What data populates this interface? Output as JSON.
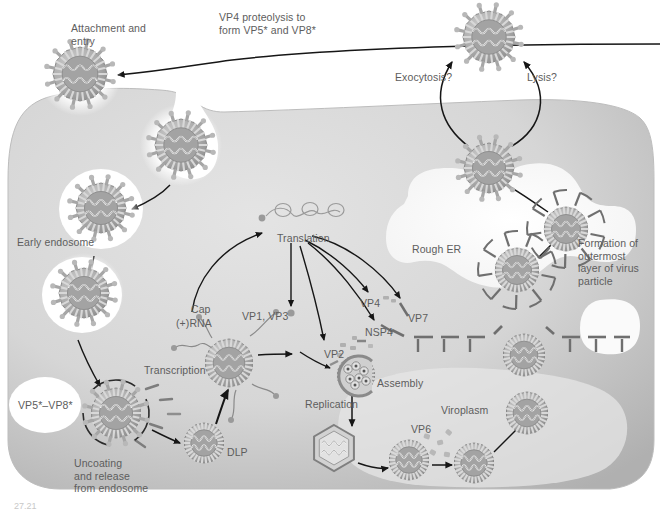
{
  "figure": {
    "caption": "27.21"
  },
  "palette": {
    "background": "#ffffff",
    "cytoplasm": "#d9d9d9",
    "cytoplasm_edge": "#a9a9a9",
    "lumen": "#fbfbfb",
    "capsid": "#9a9a9a",
    "capsid_light": "#c4c4c4",
    "text": "#5d5d5d",
    "arrow": "#1a1a1a"
  },
  "labels": {
    "attachment": "Attachment and\nentry",
    "vp4_proteolysis": "VP4 proteolysis to\nform VP5* and VP8*",
    "exocytosis": "Exocytosis?",
    "lysis": "Lysis?",
    "early_endosome": "Early endosome",
    "vp5_vp8": "VP5*–VP8*",
    "uncoating": "Uncoating\nand release\nfrom endosome",
    "transcription": "Transcription",
    "dlp": "DLP",
    "cap": "Cap",
    "plus_rna": "(+)RNA",
    "translation": "Translation",
    "vp1_vp3": "VP1, VP3",
    "vp2": "VP2",
    "vp4": "VP4",
    "vp6": "VP6",
    "vp7": "VP7",
    "nsp4": "NSP4",
    "assembly": "Assembly",
    "replication": "Replication",
    "viroplasm": "Viroplasm",
    "rough_er": "Rough ER",
    "formation": "Formation of\noutermost\nlayer of virus\nparticle"
  },
  "label_positions": [
    {
      "key": "attachment",
      "name": "label-attachment-and-entry",
      "x": 71,
      "y": 22,
      "align": "left"
    },
    {
      "key": "vp4_proteolysis",
      "name": "label-vp4-proteolysis",
      "x": 219,
      "y": 11,
      "align": "left"
    },
    {
      "key": "exocytosis",
      "name": "label-exocytosis",
      "x": 395,
      "y": 71,
      "align": "left"
    },
    {
      "key": "lysis",
      "name": "label-lysis",
      "x": 527,
      "y": 71,
      "align": "left"
    },
    {
      "key": "early_endosome",
      "name": "label-early-endosome",
      "x": 17,
      "y": 236,
      "align": "left"
    },
    {
      "key": "vp5_vp8",
      "name": "label-vp5-vp8",
      "x": 18,
      "y": 399,
      "align": "left"
    },
    {
      "key": "uncoating",
      "name": "label-uncoating-and-release",
      "x": 74,
      "y": 457,
      "align": "left"
    },
    {
      "key": "transcription",
      "name": "label-transcription",
      "x": 144,
      "y": 364,
      "align": "left"
    },
    {
      "key": "dlp",
      "name": "label-dlp",
      "x": 227,
      "y": 446,
      "align": "left"
    },
    {
      "key": "cap",
      "name": "label-cap",
      "x": 191,
      "y": 303,
      "align": "left"
    },
    {
      "key": "plus_rna",
      "name": "label-plus-rna",
      "x": 176,
      "y": 317,
      "align": "left"
    },
    {
      "key": "translation",
      "name": "label-translation",
      "x": 277,
      "y": 232,
      "align": "left"
    },
    {
      "key": "vp1_vp3",
      "name": "label-vp1-vp3",
      "x": 242,
      "y": 310,
      "align": "left"
    },
    {
      "key": "vp2",
      "name": "label-vp2",
      "x": 324,
      "y": 348,
      "align": "left"
    },
    {
      "key": "vp4",
      "name": "label-vp4",
      "x": 360,
      "y": 297,
      "align": "left"
    },
    {
      "key": "vp6",
      "name": "label-vp6",
      "x": 411,
      "y": 423,
      "align": "left"
    },
    {
      "key": "vp7",
      "name": "label-vp7",
      "x": 408,
      "y": 312,
      "align": "left"
    },
    {
      "key": "nsp4",
      "name": "label-nsp4",
      "x": 365,
      "y": 326,
      "align": "left"
    },
    {
      "key": "assembly",
      "name": "label-assembly",
      "x": 377,
      "y": 377,
      "align": "left"
    },
    {
      "key": "replication",
      "name": "label-replication",
      "x": 305,
      "y": 398,
      "align": "left"
    },
    {
      "key": "viroplasm",
      "name": "label-viroplasm",
      "x": 441,
      "y": 404,
      "align": "left"
    },
    {
      "key": "rough_er",
      "name": "label-rough-er",
      "x": 412,
      "y": 243,
      "align": "left"
    },
    {
      "key": "formation",
      "name": "label-formation-outermost-layer",
      "x": 578,
      "y": 237,
      "align": "left"
    }
  ],
  "particles": [
    {
      "name": "virion-extracellular-entry",
      "type": "triple-layered",
      "cx": 80,
      "cy": 74,
      "r": 27,
      "spikes": true,
      "halo": true
    },
    {
      "name": "virion-endocytic-pit",
      "type": "triple-layered",
      "cx": 181,
      "cy": 145,
      "r": 26,
      "spikes": true,
      "halo": true
    },
    {
      "name": "virion-early-endosome-upper",
      "type": "triple-layered",
      "cx": 101,
      "cy": 208,
      "r": 25,
      "spikes": true,
      "halo": true
    },
    {
      "name": "virion-early-endosome-lower",
      "type": "triple-layered",
      "cx": 84,
      "cy": 293,
      "r": 25,
      "spikes": true,
      "halo": true
    },
    {
      "name": "virion-uncoating",
      "type": "uncoating",
      "cx": 116,
      "cy": 413,
      "r": 25,
      "spikes": true,
      "halo": false
    },
    {
      "name": "dlp-particle",
      "type": "double-layered",
      "cx": 204,
      "cy": 443,
      "r": 20,
      "spikes": false,
      "halo": false
    },
    {
      "name": "dlp-transcribing",
      "type": "double-layered",
      "cx": 229,
      "cy": 363,
      "r": 24,
      "spikes": false,
      "halo": false
    },
    {
      "name": "core-replication",
      "type": "core-hex",
      "cx": 334,
      "cy": 448,
      "r": 20,
      "spikes": false,
      "halo": false
    },
    {
      "name": "assembly-intermediate",
      "type": "assembly",
      "cx": 356,
      "cy": 375,
      "r": 19,
      "spikes": false,
      "halo": false
    },
    {
      "name": "dlp-viroplasm-left",
      "type": "double-layered",
      "cx": 409,
      "cy": 460,
      "r": 20,
      "spikes": false,
      "halo": false
    },
    {
      "name": "dlp-viroplasm-right",
      "type": "double-layered",
      "cx": 474,
      "cy": 463,
      "r": 20,
      "spikes": false,
      "halo": false
    },
    {
      "name": "dlp-viroplasm-upper",
      "type": "double-layered",
      "cx": 527,
      "cy": 413,
      "r": 21,
      "spikes": false,
      "halo": false
    },
    {
      "name": "dlp-budding-er",
      "type": "double-layered",
      "cx": 524,
      "cy": 355,
      "r": 21,
      "spikes": false,
      "halo": false
    },
    {
      "name": "particle-er-lumen-enveloped",
      "type": "enveloped",
      "cx": 517,
      "cy": 270,
      "r": 22,
      "spikes": false,
      "halo": false
    },
    {
      "name": "particle-er-lumen-forming",
      "type": "enveloped",
      "cx": 566,
      "cy": 229,
      "r": 22,
      "spikes": false,
      "halo": false
    },
    {
      "name": "virion-mature-intracellular",
      "type": "triple-layered",
      "cx": 489,
      "cy": 168,
      "r": 25,
      "spikes": true,
      "halo": false
    },
    {
      "name": "virion-released",
      "type": "triple-layered",
      "cx": 489,
      "cy": 37,
      "r": 26,
      "spikes": true,
      "halo": false
    }
  ],
  "proteins": {
    "vp4_spikes": "VP4",
    "vp7_segments": "VP7",
    "nsp4_segments": "NSP4",
    "vp6_subunits": "VP6",
    "vp2_subunits": "VP2",
    "vp1_vp3_dots": "VP1, VP3"
  }
}
